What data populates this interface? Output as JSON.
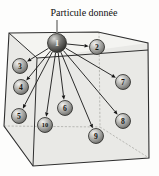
{
  "diagram": {
    "label": "Particule donnée",
    "given_particle_id": "1",
    "particles": [
      {
        "id": "1",
        "x": 57,
        "y": 43,
        "r": 9.5,
        "given": true
      },
      {
        "id": "2",
        "x": 97,
        "y": 47,
        "r": 7.5,
        "given": false
      },
      {
        "id": "3",
        "x": 20,
        "y": 66,
        "r": 7.5,
        "given": false
      },
      {
        "id": "4",
        "x": 21,
        "y": 87,
        "r": 7.5,
        "given": false
      },
      {
        "id": "5",
        "x": 19,
        "y": 116,
        "r": 7.5,
        "given": false
      },
      {
        "id": "6",
        "x": 65,
        "y": 108,
        "r": 7.5,
        "given": false
      },
      {
        "id": "7",
        "x": 123,
        "y": 82,
        "r": 7.5,
        "given": false
      },
      {
        "id": "8",
        "x": 123,
        "y": 121,
        "r": 7.5,
        "given": false
      },
      {
        "id": "9",
        "x": 96,
        "y": 136,
        "r": 7.5,
        "given": false
      },
      {
        "id": "10",
        "x": 45,
        "y": 125,
        "r": 7.5,
        "given": false
      }
    ],
    "arrows": {
      "from": "1",
      "to": [
        "2",
        "3",
        "4",
        "5",
        "6",
        "7",
        "8",
        "9",
        "10"
      ]
    },
    "label_anchor": {
      "x": 84,
      "y": 16,
      "font_size": 10
    },
    "leader_line": {
      "x1": 57,
      "y1": 20,
      "x2": 57,
      "y2": 33
    },
    "cube": {
      "outline": [
        [
          9,
          33
        ],
        [
          98,
          32
        ],
        [
          148,
          43
        ],
        [
          149,
          158
        ],
        [
          33,
          166
        ],
        [
          4,
          126
        ]
      ],
      "top_face": [
        [
          9,
          33
        ],
        [
          98,
          32
        ],
        [
          148,
          43
        ],
        [
          37,
          58
        ]
      ],
      "solid_edges": [
        [
          [
            9,
            33
          ],
          [
            37,
            58
          ]
        ],
        [
          [
            37,
            58
          ],
          [
            148,
            50
          ]
        ],
        [
          [
            37,
            58
          ],
          [
            33,
            166
          ]
        ]
      ],
      "hidden_edges": [
        [
          [
            99,
            32
          ],
          [
            100,
            127
          ]
        ],
        [
          [
            4,
            126
          ],
          [
            100,
            127
          ]
        ],
        [
          [
            100,
            127
          ],
          [
            149,
            158
          ]
        ]
      ]
    },
    "colors": {
      "paper": "#fdfdfc",
      "cube_fill": "#e9e9e6",
      "top_face_fill": "#f4f4f1",
      "edge": "#2f2f2f",
      "hidden_edge": "#b3b3af",
      "arrow": "#161616",
      "leader": "#8a8a88",
      "label_text": "#111111",
      "digit": "#14140f",
      "digit_given": "#eeeeea"
    }
  }
}
